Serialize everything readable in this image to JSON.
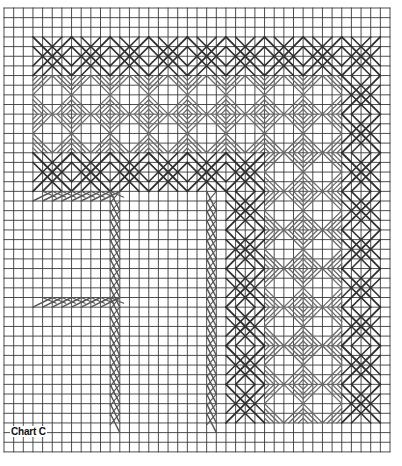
{
  "chart": {
    "label": "Chart C",
    "grid": {
      "origin_x": 4,
      "origin_y": 8,
      "cell": 9.65,
      "cols": 40,
      "rows": 46,
      "line_color": "#3a3a3a"
    },
    "colors": {
      "star": "#2e2e2e",
      "diagonal": "#6a6a6a",
      "herringbone": "#555555"
    },
    "stars": [
      [
        3,
        3
      ],
      [
        7,
        3
      ],
      [
        11,
        3
      ],
      [
        15,
        3
      ],
      [
        19,
        3
      ],
      [
        23,
        3
      ],
      [
        27,
        3
      ],
      [
        31,
        3
      ],
      [
        35,
        3
      ],
      [
        35,
        7
      ],
      [
        35,
        11
      ],
      [
        3,
        15
      ],
      [
        7,
        15
      ],
      [
        11,
        15
      ],
      [
        15,
        15
      ],
      [
        19,
        15
      ],
      [
        23,
        15
      ],
      [
        35,
        15
      ],
      [
        23,
        19
      ],
      [
        35,
        19
      ],
      [
        23,
        23
      ],
      [
        35,
        23
      ],
      [
        23,
        27
      ],
      [
        35,
        27
      ],
      [
        23,
        31
      ],
      [
        35,
        31
      ],
      [
        23,
        35
      ],
      [
        35,
        35
      ],
      [
        23,
        39
      ],
      [
        35,
        39
      ]
    ],
    "diagonal_blocks": [
      [
        3,
        7
      ],
      [
        7,
        7
      ],
      [
        11,
        7
      ],
      [
        15,
        7
      ],
      [
        19,
        7
      ],
      [
        23,
        7
      ],
      [
        27,
        7
      ],
      [
        31,
        7
      ],
      [
        3,
        11
      ],
      [
        7,
        11
      ],
      [
        11,
        11
      ],
      [
        15,
        11
      ],
      [
        19,
        11
      ],
      [
        23,
        11
      ],
      [
        27,
        11
      ],
      [
        31,
        11
      ],
      [
        27,
        15
      ],
      [
        31,
        15
      ],
      [
        27,
        19
      ],
      [
        31,
        19
      ],
      [
        27,
        23
      ],
      [
        31,
        23
      ],
      [
        27,
        27
      ],
      [
        31,
        27
      ],
      [
        27,
        31
      ],
      [
        31,
        31
      ],
      [
        27,
        35
      ],
      [
        31,
        35
      ],
      [
        27,
        39
      ],
      [
        31,
        39
      ]
    ],
    "herringbone": [
      {
        "dir": "h",
        "col": 3,
        "row": 19,
        "len": 8
      },
      {
        "dir": "h",
        "col": 3,
        "row": 30,
        "len": 8
      },
      {
        "dir": "v",
        "col": 11,
        "row": 19,
        "len": 24
      },
      {
        "dir": "v",
        "col": 21,
        "row": 19,
        "len": 24
      }
    ]
  }
}
